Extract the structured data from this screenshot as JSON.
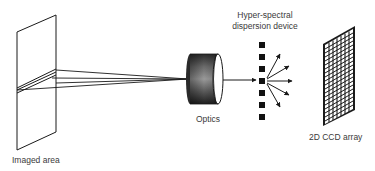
{
  "diagram": {
    "type": "hyperspectral-imaging-schematic",
    "labels": {
      "imaged_area": "Imaged area",
      "optics": "Optics",
      "dispersion_line1": "Hyper-spectral",
      "dispersion_line2": "dispersion device",
      "ccd": "2D CCD array"
    },
    "components": [
      {
        "id": "imaged-area",
        "label": "Imaged area"
      },
      {
        "id": "optics",
        "label": "Optics"
      },
      {
        "id": "dispersion-device",
        "label": "Hyper-spectral dispersion device"
      },
      {
        "id": "ccd-array",
        "label": "2D CCD array"
      }
    ],
    "flow": [
      "imaged-area",
      "optics",
      "dispersion-device",
      "ccd-array"
    ],
    "dispersion_squares": 7,
    "dispersed_rays": 5,
    "colors": {
      "line": "#1a1a1a",
      "text": "#3a3a3a",
      "background": "#ffffff"
    }
  }
}
